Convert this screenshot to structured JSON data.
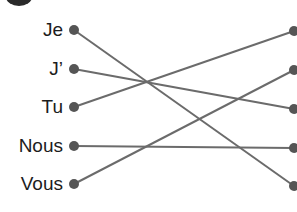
{
  "exercise": {
    "left_items": [
      {
        "label": "Je",
        "y": 30
      },
      {
        "label": "J’",
        "y": 69
      },
      {
        "label": "Tu",
        "y": 107
      },
      {
        "label": "Nous",
        "y": 146
      },
      {
        "label": "Vous",
        "y": 184
      }
    ],
    "right_dots_y": [
      31,
      70,
      109,
      148,
      186
    ],
    "connections": [
      {
        "from": "Je",
        "to_right_index": 5
      },
      {
        "from": "J’",
        "to_right_index": 3
      },
      {
        "from": "Tu",
        "to_right_index": 1
      },
      {
        "from": "Nous",
        "to_right_index": 4
      },
      {
        "from": "Vous",
        "to_right_index": 2
      }
    ]
  },
  "colors": {
    "line": "#6b6b6b",
    "dot": "#555555",
    "text": "#1c1c1c"
  }
}
